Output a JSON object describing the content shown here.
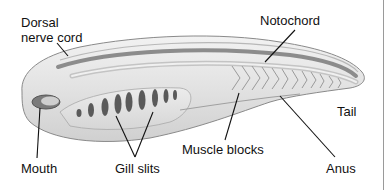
{
  "diagram": {
    "labels": {
      "dorsal_nerve_cord": "Dorsal\nnerve cord",
      "dorsal_line1": "Dorsal",
      "dorsal_line2": "nerve cord",
      "notochord": "Notochord",
      "tail": "Tail",
      "muscle_blocks": "Muscle blocks",
      "anus": "Anus",
      "gill_slits": "Gill slits",
      "mouth": "Mouth"
    },
    "colors": {
      "body_fill": "#e4e4e4",
      "body_outline": "#8a8a8a",
      "nerve_cord": "#8c8c8c",
      "gill_slit": "#5a5a5a",
      "leader_line": "#111111"
    },
    "gill_slit_count": 8,
    "muscle_block_count": 12
  }
}
